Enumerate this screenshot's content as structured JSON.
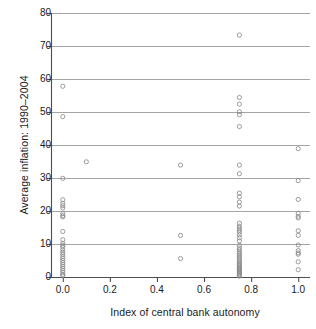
{
  "chart_data": {
    "type": "scatter",
    "title": "",
    "xlabel": "Index of central bank autonomy",
    "ylabel": "Average inflation: 1990–2004",
    "xlim": [
      -0.05,
      1.05
    ],
    "ylim": [
      0,
      80
    ],
    "xticks": [
      "0.0",
      "0.2",
      "0.4",
      "0.6",
      "0.8",
      "1.0"
    ],
    "xtick_values": [
      0.0,
      0.2,
      0.4,
      0.6,
      0.8,
      1.0
    ],
    "yticks": [
      "0",
      "10",
      "20",
      "30",
      "40",
      "50",
      "60",
      "70",
      "80"
    ],
    "ytick_values": [
      0,
      10,
      20,
      30,
      40,
      50,
      60,
      70,
      80
    ],
    "grid": "horizontal",
    "legend": "none",
    "marker": "open-circle",
    "marker_color": "#8a8a8a",
    "axis_color": "#4d4d4d",
    "grid_color": "#9b9b9b",
    "points": [
      {
        "x": 0.0,
        "y": 57.8
      },
      {
        "x": 0.0,
        "y": 48.6
      },
      {
        "x": 0.0,
        "y": 29.9
      },
      {
        "x": 0.0,
        "y": 23.4
      },
      {
        "x": 0.0,
        "y": 22.3
      },
      {
        "x": 0.0,
        "y": 21.6
      },
      {
        "x": 0.0,
        "y": 20.9
      },
      {
        "x": 0.0,
        "y": 19.2
      },
      {
        "x": 0.0,
        "y": 18.6
      },
      {
        "x": 0.0,
        "y": 18.2
      },
      {
        "x": 0.0,
        "y": 13.8
      },
      {
        "x": 0.0,
        "y": 11.3
      },
      {
        "x": 0.0,
        "y": 10.2
      },
      {
        "x": 0.0,
        "y": 9.6
      },
      {
        "x": 0.0,
        "y": 9.1
      },
      {
        "x": 0.0,
        "y": 8.2
      },
      {
        "x": 0.0,
        "y": 7.5
      },
      {
        "x": 0.0,
        "y": 6.9
      },
      {
        "x": 0.0,
        "y": 6.2
      },
      {
        "x": 0.0,
        "y": 5.6
      },
      {
        "x": 0.0,
        "y": 5.0
      },
      {
        "x": 0.0,
        "y": 4.4
      },
      {
        "x": 0.0,
        "y": 3.8
      },
      {
        "x": 0.0,
        "y": 3.2
      },
      {
        "x": 0.0,
        "y": 2.6
      },
      {
        "x": 0.0,
        "y": 2.0
      },
      {
        "x": 0.0,
        "y": 1.4
      },
      {
        "x": 0.0,
        "y": 0.8
      },
      {
        "x": 0.0,
        "y": 0.4
      },
      {
        "x": 0.1,
        "y": 34.9
      },
      {
        "x": 0.5,
        "y": 33.9
      },
      {
        "x": 0.5,
        "y": 12.6
      },
      {
        "x": 0.5,
        "y": 5.6
      },
      {
        "x": 0.75,
        "y": 73.3
      },
      {
        "x": 0.75,
        "y": 54.4
      },
      {
        "x": 0.75,
        "y": 52.4
      },
      {
        "x": 0.75,
        "y": 50.1
      },
      {
        "x": 0.75,
        "y": 49.2
      },
      {
        "x": 0.75,
        "y": 45.6
      },
      {
        "x": 0.75,
        "y": 33.9
      },
      {
        "x": 0.75,
        "y": 31.3
      },
      {
        "x": 0.75,
        "y": 25.4
      },
      {
        "x": 0.75,
        "y": 24.3
      },
      {
        "x": 0.75,
        "y": 22.7
      },
      {
        "x": 0.75,
        "y": 21.5
      },
      {
        "x": 0.75,
        "y": 16.3
      },
      {
        "x": 0.75,
        "y": 15.4
      },
      {
        "x": 0.75,
        "y": 14.8
      },
      {
        "x": 0.75,
        "y": 14.2
      },
      {
        "x": 0.75,
        "y": 13.6
      },
      {
        "x": 0.75,
        "y": 12.8
      },
      {
        "x": 0.75,
        "y": 11.9
      },
      {
        "x": 0.75,
        "y": 10.9
      },
      {
        "x": 0.75,
        "y": 9.6
      },
      {
        "x": 0.75,
        "y": 8.8
      },
      {
        "x": 0.75,
        "y": 8.2
      },
      {
        "x": 0.75,
        "y": 7.6
      },
      {
        "x": 0.75,
        "y": 7.1
      },
      {
        "x": 0.75,
        "y": 6.6
      },
      {
        "x": 0.75,
        "y": 6.1
      },
      {
        "x": 0.75,
        "y": 5.6
      },
      {
        "x": 0.75,
        "y": 5.1
      },
      {
        "x": 0.75,
        "y": 4.6
      },
      {
        "x": 0.75,
        "y": 4.2
      },
      {
        "x": 0.75,
        "y": 3.8
      },
      {
        "x": 0.75,
        "y": 3.4
      },
      {
        "x": 0.75,
        "y": 3.0
      },
      {
        "x": 0.75,
        "y": 2.7
      },
      {
        "x": 0.75,
        "y": 2.4
      },
      {
        "x": 0.75,
        "y": 2.1
      },
      {
        "x": 0.75,
        "y": 1.8
      },
      {
        "x": 0.75,
        "y": 1.5
      },
      {
        "x": 0.75,
        "y": 1.2
      },
      {
        "x": 0.75,
        "y": 0.9
      },
      {
        "x": 0.75,
        "y": 0.6
      },
      {
        "x": 0.75,
        "y": 0.3
      },
      {
        "x": 1.0,
        "y": 38.9
      },
      {
        "x": 1.0,
        "y": 29.2
      },
      {
        "x": 1.0,
        "y": 23.5
      },
      {
        "x": 1.0,
        "y": 19.3
      },
      {
        "x": 1.0,
        "y": 18.4
      },
      {
        "x": 1.0,
        "y": 17.9
      },
      {
        "x": 1.0,
        "y": 14.0
      },
      {
        "x": 1.0,
        "y": 12.6
      },
      {
        "x": 1.0,
        "y": 9.7
      },
      {
        "x": 1.0,
        "y": 8.0
      },
      {
        "x": 1.0,
        "y": 7.3
      },
      {
        "x": 1.0,
        "y": 6.9
      },
      {
        "x": 1.0,
        "y": 4.6
      },
      {
        "x": 1.0,
        "y": 2.2
      }
    ]
  }
}
